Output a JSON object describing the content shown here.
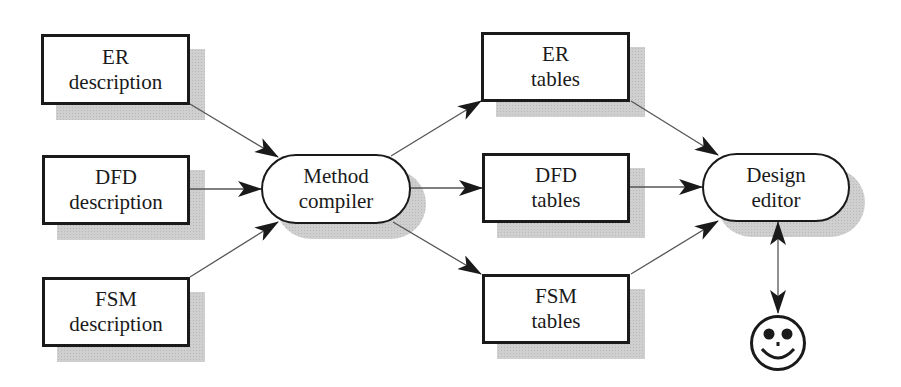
{
  "diagram": {
    "type": "flow",
    "nodes": [
      {
        "id": "er_desc",
        "shape": "rect",
        "lines": [
          "ER",
          "description"
        ],
        "x": 41,
        "y": 34,
        "w": 149,
        "h": 71
      },
      {
        "id": "dfd_desc",
        "shape": "rect",
        "lines": [
          "DFD",
          "description"
        ],
        "x": 42,
        "y": 155,
        "w": 148,
        "h": 70
      },
      {
        "id": "fsm_desc",
        "shape": "rect",
        "lines": [
          "FSM",
          "description"
        ],
        "x": 42,
        "y": 277,
        "w": 148,
        "h": 70
      },
      {
        "id": "method_compiler",
        "shape": "pill",
        "lines": [
          "Method",
          "compiler"
        ],
        "x": 261,
        "y": 154,
        "w": 150,
        "h": 70
      },
      {
        "id": "er_tables",
        "shape": "rect",
        "lines": [
          "ER",
          "tables"
        ],
        "x": 481,
        "y": 32,
        "w": 149,
        "h": 70
      },
      {
        "id": "dfd_tables",
        "shape": "rect",
        "lines": [
          "DFD",
          "tables"
        ],
        "x": 482,
        "y": 153,
        "w": 148,
        "h": 70
      },
      {
        "id": "fsm_tables",
        "shape": "rect",
        "lines": [
          "FSM",
          "tables"
        ],
        "x": 482,
        "y": 274,
        "w": 148,
        "h": 70
      },
      {
        "id": "design_editor",
        "shape": "pill",
        "lines": [
          "Design",
          "editor"
        ],
        "x": 702,
        "y": 153,
        "w": 148,
        "h": 69
      }
    ],
    "edges": [
      {
        "from": "er_desc",
        "to": "method_compiler",
        "x1": 190,
        "y1": 104,
        "x2": 278,
        "y2": 157
      },
      {
        "from": "dfd_desc",
        "to": "method_compiler",
        "x1": 190,
        "y1": 189,
        "x2": 261,
        "y2": 189
      },
      {
        "from": "fsm_desc",
        "to": "method_compiler",
        "x1": 190,
        "y1": 277,
        "x2": 278,
        "y2": 222
      },
      {
        "from": "method_compiler",
        "to": "er_tables",
        "x1": 391,
        "y1": 156,
        "x2": 481,
        "y2": 101
      },
      {
        "from": "method_compiler",
        "to": "dfd_tables",
        "x1": 411,
        "y1": 188,
        "x2": 482,
        "y2": 188
      },
      {
        "from": "method_compiler",
        "to": "fsm_tables",
        "x1": 393,
        "y1": 222,
        "x2": 481,
        "y2": 274
      },
      {
        "from": "er_tables",
        "to": "design_editor",
        "x1": 631,
        "y1": 101,
        "x2": 718,
        "y2": 155
      },
      {
        "from": "dfd_tables",
        "to": "design_editor",
        "x1": 630,
        "y1": 187,
        "x2": 702,
        "y2": 187
      },
      {
        "from": "fsm_tables",
        "to": "design_editor",
        "x1": 631,
        "y1": 274,
        "x2": 718,
        "y2": 221
      },
      {
        "from": "design_editor",
        "to": "user",
        "bidirectional": true,
        "x1": 778,
        "y1": 222,
        "x2": 778,
        "y2": 313
      }
    ],
    "user_icon": {
      "name": "smiley-face-icon",
      "cx": 778,
      "cy": 343,
      "r": 27
    }
  },
  "colors": {
    "stroke": "#1a1a1a",
    "edge": "#555555",
    "shadow": "#cfcfcf",
    "background": "#ffffff"
  }
}
